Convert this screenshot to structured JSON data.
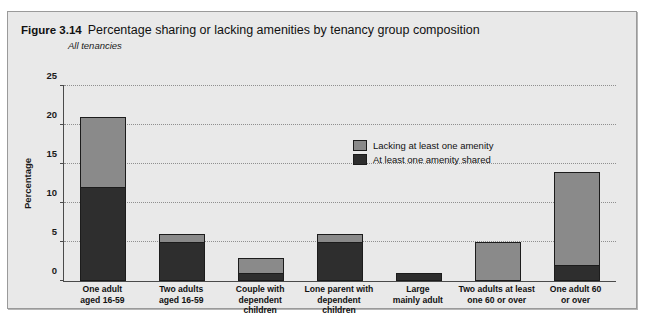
{
  "figure": {
    "number": "Figure 3.14",
    "title": "Percentage sharing or lacking amenities by tenancy group composition",
    "subtitle": "All tenancies"
  },
  "legend": {
    "items": [
      {
        "label": "Lacking at least one amenity",
        "color": "#8a8a8a"
      },
      {
        "label": "At least one amenity shared",
        "color": "#2e2e2e"
      }
    ]
  },
  "chart_data": {
    "type": "bar",
    "stacked": true,
    "title": "Percentage sharing or lacking amenities by tenancy group composition",
    "subtitle": "All tenancies",
    "xlabel": "",
    "ylabel": "Percentage",
    "ylim": [
      0,
      25
    ],
    "yticks": [
      0,
      5,
      10,
      15,
      20,
      25
    ],
    "grid": true,
    "legend_position": "inside-upper-right",
    "categories": [
      "One adult aged 16-59",
      "Two adults aged 16-59",
      "Couple with dependent children",
      "Lone parent with dependent children",
      "Large mainly adult",
      "Two adults at least one 60 or over",
      "One adult 60 or over"
    ],
    "category_lines": [
      [
        "One adult",
        "aged 16-59"
      ],
      [
        "Two adults",
        "aged 16-59"
      ],
      [
        "Couple with",
        "dependent children"
      ],
      [
        "Lone parent with",
        "dependent children"
      ],
      [
        "Large",
        "mainly adult"
      ],
      [
        "Two adults at least",
        "one 60 or over"
      ],
      [
        "One adult 60",
        "or over"
      ]
    ],
    "series": [
      {
        "name": "At least one amenity shared",
        "color": "#2e2e2e",
        "values": [
          12,
          5,
          1,
          5,
          1,
          0,
          2
        ]
      },
      {
        "name": "Lacking at least one amenity",
        "color": "#8a8a8a",
        "values": [
          9,
          1,
          2,
          1,
          0,
          5,
          12
        ]
      }
    ],
    "totals": [
      21,
      6,
      3,
      6,
      1,
      5,
      14
    ]
  }
}
